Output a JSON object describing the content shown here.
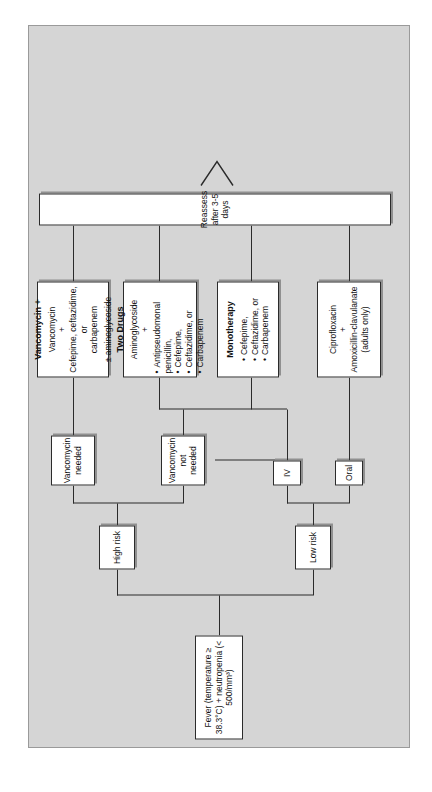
{
  "figure": {
    "panel_background": "#d5d5d5",
    "node_background": "#ffffff",
    "line_color": "#2b2b2b"
  },
  "nodes": {
    "start": {
      "label": "Fever (temperature ≥ 38.3°C) + neutropenia (< 500/mm³)"
    },
    "low_risk": {
      "label": "Low risk"
    },
    "high_risk": {
      "label": "High risk"
    },
    "oral": {
      "label": "Oral"
    },
    "iv": {
      "label": "IV"
    },
    "vanco_not_needed": {
      "line1": "Vancomycin",
      "line2": "not needed"
    },
    "vanco_needed": {
      "line1": "Vancomycin",
      "line2": "needed"
    },
    "cipro": {
      "line1": "Ciprofloxacin",
      "line2": "+",
      "line3": "Amoxicillin-clavulanate",
      "line4": "(adults only)"
    },
    "monotherapy": {
      "title": "Monotherapy",
      "bullets": [
        "Cefepime,",
        "Ceftazidime, or",
        "Carbapenem"
      ]
    },
    "two_drugs": {
      "title": "Two Drugs",
      "line1": "Aminoglycoside",
      "line2": "+",
      "bullets": [
        "Antipseudomonal penicillin,",
        "Cefepime,",
        "Ceftazidime, or",
        "Carbapenem"
      ]
    },
    "vancomycin_plus": {
      "title": "Vancomycin +",
      "line1": "Vancomycin",
      "line2": "+",
      "line3": "Cefepime, ceftazidime, or",
      "line4": "carbapenem",
      "line5": "± aminoglycoside"
    },
    "reassess": {
      "label": "Reassess after 3-5 days"
    }
  }
}
